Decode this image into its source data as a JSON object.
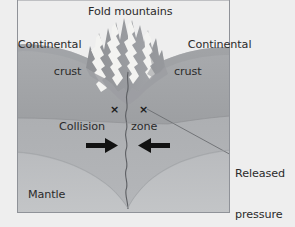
{
  "diagram": {
    "title_label": "Fold mountains",
    "labels": {
      "continental_crust_left_line1": "Continental",
      "continental_crust_left_line2": "crust",
      "continental_crust_right_line1": "Continental",
      "continental_crust_right_line2": "crust",
      "collision": "Collision",
      "zone": "zone",
      "mantle": "Mantle",
      "released_line1": "Released",
      "released_line2": "pressure",
      "released_line3": "can cause",
      "released_line4": "earthquakes"
    },
    "markers": {
      "x_left": "×",
      "x_right": "×"
    },
    "colors": {
      "background": "#eeeeee",
      "box_border": "#8f9298",
      "crust_upper": "#a6a8ab",
      "crust_lower": "#9a9c9f",
      "mantle_upper": "#b3b5b8",
      "mantle_lower": "#bdbfc2",
      "mountain_rock": "#9a9ca0",
      "mountain_snow": "#f4f4f2",
      "fault_line": "#5c5e62",
      "arrow": "#111111",
      "leader_line": "#6a6c70",
      "text": "#2b2b2b"
    }
  }
}
